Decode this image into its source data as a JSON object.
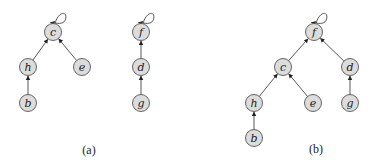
{
  "diagram": {
    "type": "disjoint-set forest",
    "panels": [
      {
        "caption": "(a)",
        "caption_pos": [
          89,
          150
        ],
        "nodes": [
          {
            "id": "c",
            "label": "c",
            "x": 53,
            "y": 32,
            "root": true
          },
          {
            "id": "h",
            "label": "h",
            "x": 28,
            "y": 67
          },
          {
            "id": "e",
            "label": "e",
            "x": 82,
            "y": 67
          },
          {
            "id": "b",
            "label": "b",
            "x": 28,
            "y": 103
          },
          {
            "id": "f",
            "label": "f",
            "x": 141,
            "y": 32,
            "root": true
          },
          {
            "id": "d",
            "label": "d",
            "x": 141,
            "y": 67
          },
          {
            "id": "g",
            "label": "g",
            "x": 141,
            "y": 103
          }
        ],
        "edges": [
          {
            "from": "h",
            "to": "c"
          },
          {
            "from": "e",
            "to": "c"
          },
          {
            "from": "b",
            "to": "h"
          },
          {
            "from": "d",
            "to": "f"
          },
          {
            "from": "g",
            "to": "d"
          }
        ]
      },
      {
        "caption": "(b)",
        "caption_pos": [
          316,
          149
        ],
        "nodes": [
          {
            "id": "f",
            "label": "f",
            "x": 314,
            "y": 32,
            "root": true
          },
          {
            "id": "c",
            "label": "c",
            "x": 283,
            "y": 67
          },
          {
            "id": "d",
            "label": "d",
            "x": 350,
            "y": 67
          },
          {
            "id": "h",
            "label": "h",
            "x": 254,
            "y": 103
          },
          {
            "id": "e",
            "label": "e",
            "x": 313,
            "y": 103
          },
          {
            "id": "g",
            "label": "g",
            "x": 350,
            "y": 103
          },
          {
            "id": "b",
            "label": "b",
            "x": 254,
            "y": 138
          }
        ],
        "edges": [
          {
            "from": "c",
            "to": "f"
          },
          {
            "from": "d",
            "to": "f"
          },
          {
            "from": "h",
            "to": "c"
          },
          {
            "from": "e",
            "to": "c"
          },
          {
            "from": "b",
            "to": "h"
          },
          {
            "from": "g",
            "to": "d"
          }
        ]
      }
    ],
    "colors": {
      "node_fill": "#dcdcdc",
      "node_stroke": "#555555",
      "edge": "#444444",
      "text": "#222222"
    },
    "node_radius": 8.5
  }
}
